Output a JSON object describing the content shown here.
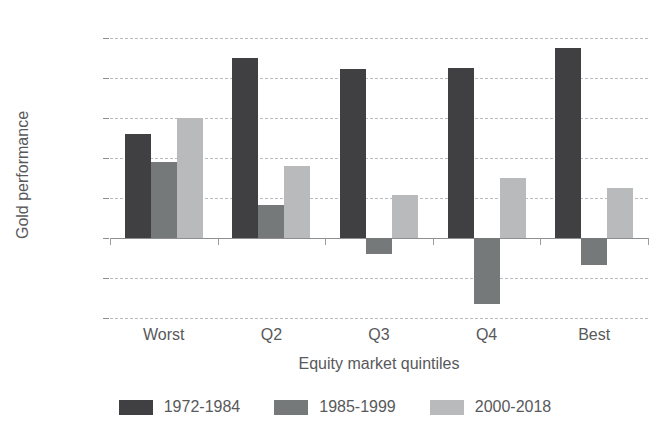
{
  "chart_data": {
    "type": "bar",
    "title": "",
    "xlabel": "Equity market quintiles",
    "ylabel": "Gold performance",
    "categories": [
      "Worst",
      "Q2",
      "Q3",
      "Q4",
      "Best"
    ],
    "series": [
      {
        "name": "1972-1984",
        "color": "#404042",
        "values": [
          13.0,
          22.5,
          21.1,
          21.3,
          23.7
        ]
      },
      {
        "name": "1985-1999",
        "color": "#76797a",
        "values": [
          9.5,
          4.1,
          -2.0,
          -8.3,
          -3.4
        ]
      },
      {
        "name": "2000-2018",
        "color": "#b8babb",
        "values": [
          15.0,
          9.0,
          5.4,
          7.5,
          6.3
        ]
      }
    ],
    "ylim": [
      -10,
      25
    ],
    "ytick_values": [
      25,
      20,
      15,
      10,
      5,
      0,
      -5,
      -10
    ],
    "ytick_labels": [
      "25%",
      "20%",
      "15%",
      "10%",
      "5%",
      "0%",
      "-5%",
      "-10%"
    ],
    "grid": true,
    "grid_axis": "y",
    "grid_style": "dashed",
    "legend_position": "bottom",
    "value_suffix": "%"
  },
  "legend": {
    "items": [
      {
        "label": "1972-1984",
        "color": "#404042"
      },
      {
        "label": "1985-1999",
        "color": "#76797a"
      },
      {
        "label": "2000-2018",
        "color": "#b8babb"
      }
    ]
  },
  "colors": {
    "series_dark": "#404042",
    "series_mid": "#76797a",
    "series_light": "#b8babb",
    "gridline": "#b9bbbd",
    "axis": "#8d8f91",
    "text": "#58595b",
    "background": "#ffffff"
  }
}
